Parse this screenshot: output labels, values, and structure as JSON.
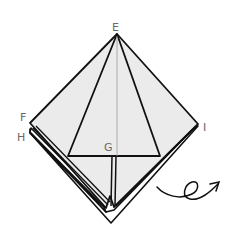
{
  "diagram": {
    "type": "origami-fold-step",
    "labels": {
      "E": "E",
      "F": "F",
      "G": "G",
      "H": "H",
      "I": "I"
    },
    "colors": {
      "paper_fill": "#ebebeb",
      "stroke": "#111111",
      "crease": "#9a9a9a",
      "label": "#6a6a6a"
    },
    "instruction_symbol": "turn-over-arrow"
  }
}
